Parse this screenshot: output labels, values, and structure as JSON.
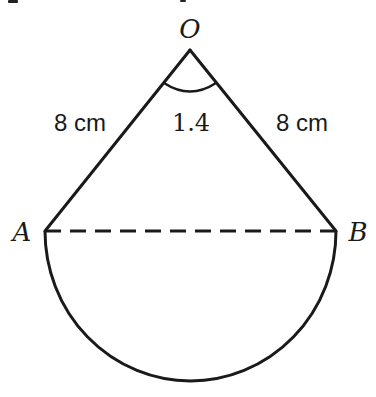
{
  "figure": {
    "apex_label": "O",
    "left_label": "A",
    "right_label": "B",
    "angle_label": "1.4",
    "left_side_label": "8 cm",
    "right_side_label": "8 cm"
  },
  "colors": {
    "stroke": "#1a1a1a",
    "background": "#ffffff"
  }
}
